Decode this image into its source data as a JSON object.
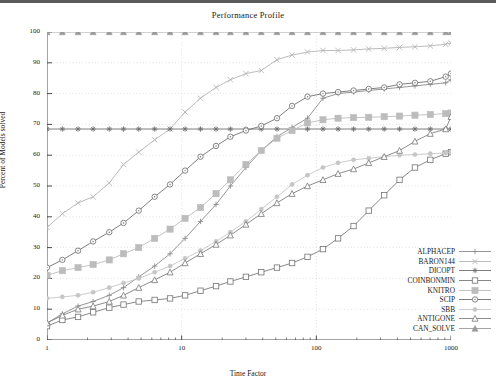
{
  "chart_data": {
    "type": "line",
    "title": "Performance Profile",
    "xlabel": "Time Factor",
    "ylabel": "Percent of Models solved",
    "xscale": "log",
    "xlim": [
      1,
      1000
    ],
    "ylim": [
      0,
      100
    ],
    "grid": true,
    "legend_position": "bottom-right",
    "xticks": [
      "1",
      "10",
      "100",
      "1000"
    ],
    "xtick_values": [
      1,
      10,
      100,
      1000
    ],
    "yticks": [
      "0",
      "10",
      "20",
      "30",
      "40",
      "50",
      "60",
      "70",
      "80",
      "90",
      "100"
    ],
    "ytick_values": [
      0,
      10,
      20,
      30,
      40,
      50,
      60,
      70,
      80,
      90,
      100
    ],
    "series": [
      {
        "name": "ALPHACEP",
        "marker": "plus",
        "color": "#8a8a8a",
        "x": [
          1,
          1.3,
          1.7,
          2.2,
          2.9,
          3.7,
          4.8,
          6.3,
          8.2,
          10.6,
          13.8,
          18,
          23,
          30,
          39,
          51,
          66,
          86,
          112,
          145,
          189,
          245,
          319,
          415,
          540,
          702,
          913,
          1000
        ],
        "y": [
          5.5,
          8.5,
          11,
          12.5,
          14.5,
          17,
          20.5,
          24,
          28,
          33,
          38.5,
          44,
          50,
          56,
          61.5,
          66,
          69,
          72,
          78.5,
          80,
          80.5,
          81,
          81.5,
          82,
          82.5,
          83,
          83.5,
          84.5
        ]
      },
      {
        "name": "BARON144",
        "marker": "x",
        "color": "#b4b4b4",
        "x": [
          1,
          1.3,
          1.7,
          2.2,
          2.9,
          3.7,
          4.8,
          6.3,
          8.2,
          10.6,
          13.8,
          18,
          23,
          30,
          39,
          51,
          66,
          86,
          112,
          145,
          189,
          245,
          319,
          415,
          540,
          702,
          913,
          1000
        ],
        "y": [
          36.5,
          41,
          44.5,
          46.5,
          51,
          57,
          61,
          65,
          68.5,
          74,
          78.5,
          82,
          84.5,
          86.5,
          87.5,
          91,
          92.5,
          93.5,
          94,
          94,
          94.2,
          94.5,
          94.7,
          95,
          95.2,
          95.5,
          96,
          96.5
        ]
      },
      {
        "name": "DICOPT",
        "marker": "star",
        "color": "#6e6e6e",
        "x": [
          1,
          1.3,
          1.7,
          2.2,
          2.9,
          3.7,
          4.8,
          6.3,
          8.2,
          10.6,
          13.8,
          18,
          23,
          30,
          39,
          51,
          66,
          86,
          112,
          145,
          189,
          245,
          319,
          415,
          540,
          702,
          913,
          1000
        ],
        "y": [
          68.5,
          68.5,
          68.5,
          68.5,
          68.5,
          68.5,
          68.5,
          68.5,
          68.5,
          68.5,
          68.5,
          68.5,
          68.5,
          68.5,
          68.5,
          68.5,
          68.5,
          68.5,
          68.5,
          68.5,
          68.5,
          68.5,
          68.5,
          68.5,
          68.5,
          68.5,
          68.5,
          68.5
        ]
      },
      {
        "name": "COINBONMIN",
        "marker": "square-open",
        "color": "#7a7a7a",
        "x": [
          1,
          1.3,
          1.7,
          2.2,
          2.9,
          3.7,
          4.8,
          6.3,
          8.2,
          10.6,
          13.8,
          18,
          23,
          30,
          39,
          51,
          66,
          86,
          112,
          145,
          189,
          245,
          319,
          415,
          540,
          702,
          913,
          1000
        ],
        "y": [
          4.5,
          6.5,
          7.5,
          9,
          10.5,
          11.5,
          12.5,
          13,
          13.5,
          14.5,
          16,
          17.5,
          19,
          20.5,
          22,
          23.5,
          25,
          27,
          29.5,
          33,
          37,
          42,
          47,
          52,
          56,
          58.5,
          60.5,
          61
        ]
      },
      {
        "name": "KNITRO",
        "marker": "square-filled",
        "color": "#bcbcbc",
        "x": [
          1,
          1.3,
          1.7,
          2.2,
          2.9,
          3.7,
          4.8,
          6.3,
          8.2,
          10.6,
          13.8,
          18,
          23,
          30,
          39,
          51,
          66,
          86,
          112,
          145,
          189,
          245,
          319,
          415,
          540,
          702,
          913,
          1000
        ],
        "y": [
          21,
          22.5,
          23.5,
          24.5,
          26,
          28,
          30,
          33,
          36,
          39.5,
          43,
          47.5,
          52,
          57,
          61.5,
          65.5,
          68,
          70.5,
          71.5,
          72,
          72.2,
          72.3,
          72.5,
          72.7,
          73,
          73.2,
          73.5,
          73.7
        ]
      },
      {
        "name": "SCIP",
        "marker": "circle-open",
        "color": "#707070",
        "x": [
          1,
          1.3,
          1.7,
          2.2,
          2.9,
          3.7,
          4.8,
          6.3,
          8.2,
          10.6,
          13.8,
          18,
          23,
          30,
          39,
          51,
          66,
          86,
          112,
          145,
          189,
          245,
          319,
          415,
          540,
          702,
          913,
          1000
        ],
        "y": [
          23.5,
          26,
          29,
          32,
          35,
          38,
          42,
          46.5,
          50.5,
          55,
          59.5,
          63,
          66,
          68,
          69.5,
          72,
          76,
          79,
          80,
          80.5,
          81,
          81.5,
          82,
          83,
          83.5,
          84,
          85.5,
          86.5
        ]
      },
      {
        "name": "SBB",
        "marker": "circle-small",
        "color": "#c6c6c6",
        "x": [
          1,
          1.3,
          1.7,
          2.2,
          2.9,
          3.7,
          4.8,
          6.3,
          8.2,
          10.6,
          13.8,
          18,
          23,
          30,
          39,
          51,
          66,
          86,
          112,
          145,
          189,
          245,
          319,
          415,
          540,
          702,
          913,
          1000
        ],
        "y": [
          13.5,
          14,
          14.5,
          15.5,
          17,
          18.5,
          20,
          22,
          24,
          26.5,
          29,
          32,
          35,
          38.5,
          42.5,
          46.5,
          50.5,
          53.5,
          56,
          57.5,
          58.5,
          59,
          59.5,
          60,
          60.2,
          60.5,
          60.7,
          61
        ]
      },
      {
        "name": "ANTIGONE",
        "marker": "triangle-open",
        "color": "#808080",
        "x": [
          1,
          1.3,
          1.7,
          2.2,
          2.9,
          3.7,
          4.8,
          6.3,
          8.2,
          10.6,
          13.8,
          18,
          23,
          30,
          39,
          51,
          66,
          86,
          112,
          145,
          189,
          245,
          319,
          415,
          540,
          702,
          913,
          1000
        ],
        "y": [
          5.5,
          8,
          10,
          11,
          12.5,
          14.5,
          17,
          19.5,
          22,
          25,
          28,
          31,
          34,
          37.5,
          41,
          44.5,
          47.5,
          50,
          52,
          54,
          55.5,
          57.5,
          59.5,
          61.5,
          64.5,
          67,
          68.5,
          72.5
        ]
      },
      {
        "name": "CAN_SOLVE",
        "marker": "triangle-filled",
        "color": "#9a9a9a",
        "x": [
          1,
          1.3,
          1.7,
          2.2,
          2.9,
          3.7,
          4.8,
          6.3,
          8.2,
          10.6,
          13.8,
          18,
          23,
          30,
          39,
          51,
          66,
          86,
          112,
          145,
          189,
          245,
          319,
          415,
          540,
          702,
          913,
          1000
        ],
        "y": [
          100,
          100,
          100,
          100,
          100,
          100,
          100,
          100,
          100,
          100,
          100,
          100,
          100,
          100,
          100,
          100,
          100,
          100,
          100,
          100,
          100,
          100,
          100,
          100,
          100,
          100,
          100,
          100
        ]
      }
    ]
  },
  "legend": {
    "entries": [
      {
        "label": "ALPHACEP"
      },
      {
        "label": "BARON144"
      },
      {
        "label": "DICOPT"
      },
      {
        "label": "COINBONMIN"
      },
      {
        "label": "KNITRO"
      },
      {
        "label": "SCIP"
      },
      {
        "label": "SBB"
      },
      {
        "label": "ANTIGONE"
      },
      {
        "label": "CAN_SOLVE"
      }
    ]
  }
}
